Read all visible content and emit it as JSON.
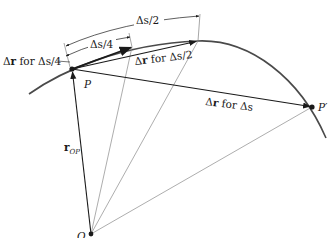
{
  "diagram": {
    "type": "kinematics-displacement-vectors",
    "colors": {
      "ink": "#1a1a1a",
      "curve": "#4a4a4a",
      "thin": "#8a8a8a",
      "background": "#ffffff"
    },
    "points": {
      "O": {
        "label": "O",
        "x": 91,
        "y": 234
      },
      "P": {
        "label": "P",
        "x": 72,
        "y": 69
      },
      "P_prime": {
        "label": "P′",
        "x": 312,
        "y": 107
      },
      "Q_quarter": {
        "x": 132,
        "y": 47
      },
      "Q_half": {
        "x": 198,
        "y": 41
      }
    },
    "labels": {
      "r_op_main": "r",
      "r_op_sub": "OP",
      "dr_quarter_delta": "Δ",
      "dr_quarter_r": "r",
      "dr_quarter_rest": " for Δs/4",
      "dr_half_delta": "Δ",
      "dr_half_r": "r",
      "dr_half_rest": " for Δs/2",
      "dr_full_delta": "Δ",
      "dr_full_r": "r",
      "dr_full_rest": " for Δs",
      "ds_quarter": "Δs/4",
      "ds_half": "Δs/2",
      "point_P": "P",
      "point_P_prime": "P′",
      "point_O": "O"
    }
  }
}
